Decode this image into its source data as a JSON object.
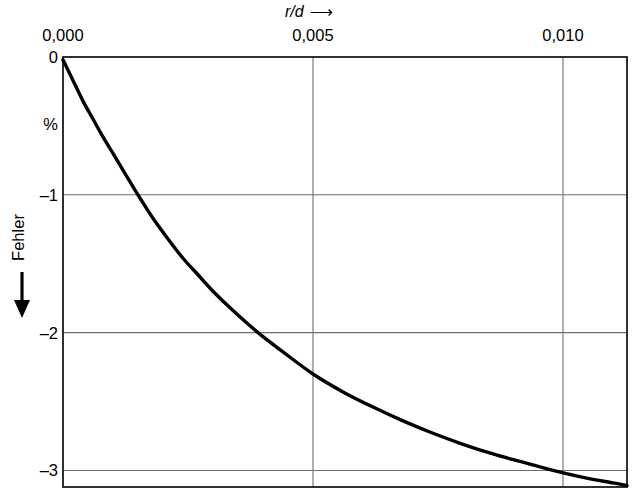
{
  "chart_data": {
    "type": "line",
    "title": "",
    "xlabel": "r/d",
    "xlabel_arrow": "⟶",
    "ylabel": "Fehler",
    "ylabel_arrow": "↓",
    "yunit": "%",
    "xlim": [
      0.0,
      0.01128
    ],
    "ylim": [
      -3.12,
      0.0
    ],
    "grid": true,
    "legend": false,
    "legend_position": "none",
    "x_ticks": [
      {
        "value": 0.0,
        "label": "0,000"
      },
      {
        "value": 0.005,
        "label": "0,005"
      },
      {
        "value": 0.01,
        "label": "0,010"
      }
    ],
    "y_ticks": [
      {
        "value": 0,
        "label": "0"
      },
      {
        "value": -1,
        "label": "–1"
      },
      {
        "value": -2,
        "label": "–2"
      },
      {
        "value": -3,
        "label": "–3"
      }
    ],
    "series": [
      {
        "name": "Fehler",
        "color": "#000000",
        "x": [
          0.0,
          0.0002,
          0.0004,
          0.0006,
          0.0008,
          0.001,
          0.0012,
          0.0015,
          0.0018,
          0.0021,
          0.0024,
          0.0027,
          0.003,
          0.0034,
          0.0039,
          0.0044,
          0.005,
          0.0056,
          0.0062,
          0.0068,
          0.0074,
          0.008,
          0.0086,
          0.0092,
          0.0098,
          0.0104,
          0.011,
          0.01128
        ],
        "y": [
          -0.02,
          -0.17,
          -0.32,
          -0.45,
          -0.58,
          -0.7,
          -0.82,
          -1.0,
          -1.17,
          -1.32,
          -1.46,
          -1.58,
          -1.7,
          -1.84,
          -2.0,
          -2.14,
          -2.3,
          -2.43,
          -2.54,
          -2.64,
          -2.73,
          -2.81,
          -2.88,
          -2.94,
          -3.0,
          -3.05,
          -3.09,
          -3.11
        ]
      }
    ]
  }
}
